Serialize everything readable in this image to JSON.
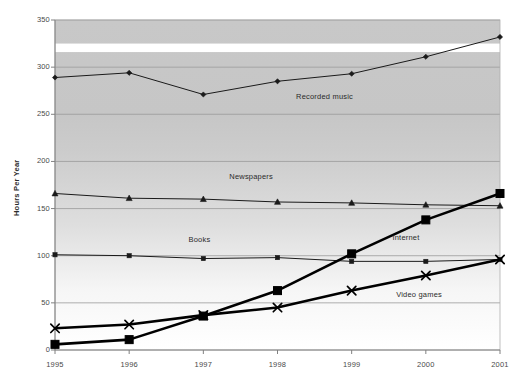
{
  "chart_data": {
    "type": "line",
    "title": "",
    "subtitle": "",
    "xlabel": "",
    "ylabel": "Hours Per Year",
    "x": [
      1995,
      1996,
      1997,
      1998,
      1999,
      2000,
      2001
    ],
    "categories": [
      "1995",
      "1996",
      "1997",
      "1998",
      "1999",
      "2000",
      "2001"
    ],
    "xtick_labels": [
      "1995",
      "1996",
      "1997",
      "1998",
      "1999",
      "2000",
      "2001"
    ],
    "ytick_labels": [
      "0",
      "50",
      "100",
      "150",
      "200",
      "250",
      "300",
      "350"
    ],
    "yticks": [
      0,
      50,
      100,
      150,
      200,
      250,
      300,
      350
    ],
    "ylim": [
      0,
      350
    ],
    "xlim": [
      1995,
      2001
    ],
    "grid": true,
    "grid_axis": "y",
    "legend": "inline-annotations",
    "legend_position": "inline",
    "background": "gray-gradient-band",
    "series": [
      {
        "name": "Recorded music",
        "values": [
          289,
          294,
          271,
          285,
          293,
          311,
          332
        ],
        "marker": "diamond",
        "color": "#1a1a1a",
        "line_width": 1,
        "label_x": 1998.25,
        "label_y": 268
      },
      {
        "name": "Newspapers",
        "values": [
          166,
          161,
          160,
          157,
          156,
          154,
          153
        ],
        "marker": "triangle",
        "color": "#1a1a1a",
        "line_width": 1,
        "label_x": 1997.35,
        "label_y": 183
      },
      {
        "name": "Books",
        "values": [
          101,
          100,
          97,
          98,
          94,
          94,
          96
        ],
        "marker": "square-small",
        "color": "#1a1a1a",
        "line_width": 1,
        "label_x": 1996.8,
        "label_y": 117
      },
      {
        "name": "Internet",
        "values": [
          6,
          11,
          36,
          63,
          102,
          138,
          166
        ],
        "marker": "square-large",
        "color": "#000000",
        "line_width": 2.6,
        "label_x": 1999.55,
        "label_y": 119
      },
      {
        "name": "Video games",
        "values": [
          23,
          27,
          37,
          45,
          63,
          79,
          96
        ],
        "marker": "x-cross",
        "color": "#000000",
        "line_width": 2.6,
        "label_x": 1999.6,
        "label_y": 58
      }
    ]
  },
  "axis": {
    "y_title": "Hours Per Year"
  }
}
